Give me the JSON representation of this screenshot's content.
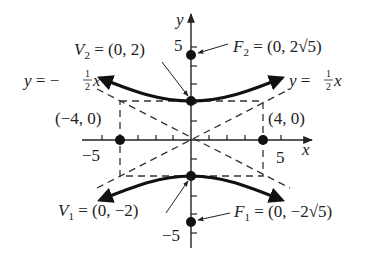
{
  "diagram": {
    "type": "hyperbola-graph",
    "equation_context": "vertical hyperbola with asymptotes y = ±(1/2)x",
    "axes": {
      "x_label": "x",
      "y_label": "y",
      "x_ticks": {
        "min": -5,
        "max": 5,
        "labeled": [
          "-5",
          "5"
        ]
      },
      "y_ticks": {
        "min": -5,
        "max": 5,
        "labeled": [
          "5",
          "-5"
        ]
      }
    },
    "points": {
      "V2": {
        "name": "V",
        "sub": "2",
        "text": " = (0, 2)",
        "x": 0,
        "y": 2
      },
      "V1": {
        "name": "V",
        "sub": "1",
        "text": " = (0, −2)",
        "x": 0,
        "y": -2
      },
      "F2": {
        "name": "F",
        "sub": "2",
        "text": " = (0, 2√5)",
        "x": 0,
        "y": 4.472
      },
      "F1": {
        "name": "F",
        "sub": "1",
        "text": " = (0, −2√5)",
        "x": 0,
        "y": -4.472
      },
      "P_left": {
        "text": "(−4, 0)",
        "x": -4,
        "y": 0
      },
      "P_right": {
        "text": "(4, 0)",
        "x": 4,
        "y": 0
      }
    },
    "asymptotes": {
      "left": {
        "lhs": "y = −",
        "num": "1",
        "den": "2",
        "var": "x"
      },
      "right": {
        "lhs": "y = ",
        "num": "1",
        "den": "2",
        "var": "x"
      }
    },
    "tick_labels": {
      "x_neg": "−5",
      "x_pos": "5",
      "y_pos": "5",
      "y_neg": "−5"
    },
    "fundamental_rectangle": {
      "x_min": -4,
      "x_max": 4,
      "y_min": -2,
      "y_max": 2
    }
  }
}
